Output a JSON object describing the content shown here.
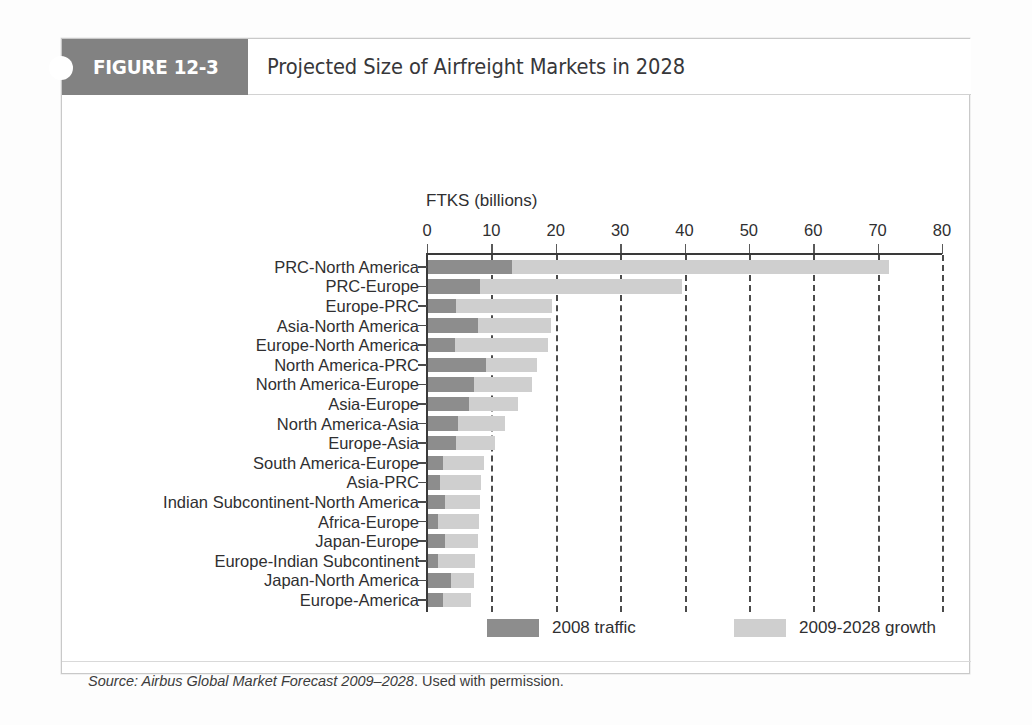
{
  "figure": {
    "tab_label": "FIGURE 12-3",
    "title": "Projected Size of Airfreight Markets in 2028",
    "source_prefix": "Source: Airbus Global Market Forecast 2009–2028",
    "source_suffix": ". Used with permission."
  },
  "colors": {
    "tab_background": "#828282",
    "tab_text": "#ffffff",
    "series_2008_traffic": "#8d8d8d",
    "series_growth": "#cfcfcf",
    "axis": "#3a3a3a",
    "gridline": "#4b4b4b",
    "text": "#2f2f31",
    "frame_border": "#c9c9c9"
  },
  "legend": {
    "position": "bottom",
    "items": [
      {
        "label": "2008 traffic",
        "color": "#8d8d8d"
      },
      {
        "label": "2009-2028 growth",
        "color": "#cfcfcf"
      }
    ]
  },
  "chart_data": {
    "type": "bar",
    "orientation": "horizontal",
    "stacked": true,
    "title": "Projected Size of Airfreight Markets in 2028",
    "xlabel": "FTKS (billions)",
    "ylabel": "",
    "xlim": [
      0,
      80
    ],
    "xticks": [
      0,
      10,
      20,
      30,
      40,
      50,
      60,
      70,
      80
    ],
    "xtick_labels": [
      "0",
      "10",
      "20",
      "30",
      "40",
      "50",
      "60",
      "70",
      "80"
    ],
    "grid": "vertical-dashed",
    "categories": [
      "PRC-North America",
      "PRC-Europe",
      "Europe-PRC",
      "Asia-North America",
      "Europe-North America",
      "North America-PRC",
      "North America-Europe",
      "Asia-Europe",
      "North America-Asia",
      "Europe-Asia",
      "South America-Europe",
      "Asia-PRC",
      "Indian Subcontinent-North America",
      "Africa-Europe",
      "Japan-Europe",
      "Europe-Indian Subcontinent",
      "Japan-North America",
      "Europe-America"
    ],
    "series": [
      {
        "name": "2008 traffic",
        "color": "#8d8d8d",
        "values": [
          13.0,
          8.1,
          4.4,
          7.8,
          4.2,
          9.0,
          7.2,
          6.4,
          4.7,
          4.4,
          2.3,
          1.9,
          2.7,
          1.5,
          2.6,
          1.5,
          3.5,
          2.3
        ]
      },
      {
        "name": "2009-2028 growth",
        "color": "#cfcfcf",
        "values": [
          58.6,
          31.3,
          14.9,
          11.3,
          14.4,
          8.0,
          8.9,
          7.6,
          7.2,
          6.0,
          6.4,
          6.4,
          5.4,
          6.4,
          5.1,
          5.8,
          3.6,
          4.4
        ]
      }
    ],
    "totals": [
      71.6,
      39.4,
      19.3,
      19.1,
      18.6,
      17.0,
      16.1,
      14.0,
      11.9,
      10.4,
      8.7,
      8.3,
      8.1,
      7.9,
      7.7,
      7.3,
      7.1,
      6.7
    ]
  }
}
